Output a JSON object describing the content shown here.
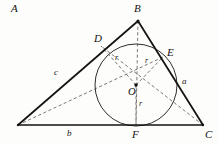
{
  "figure": {
    "background_color": "#fdfdfc",
    "stroke_color": "#15120f",
    "dash_color": "#5a5category"
  },
  "vertices": [
    {
      "name": "A",
      "label": "A",
      "x": 18,
      "y": 125,
      "label_x": 11,
      "label_y": 129
    },
    {
      "name": "B",
      "label": "B",
      "x": 138,
      "y": 21,
      "label_x": 134,
      "label_y": 3
    },
    {
      "name": "C",
      "label": "C",
      "x": 203,
      "y": 125,
      "label_x": 205,
      "label_y": 129
    }
  ],
  "tangent_points": [
    {
      "name": "D",
      "label": "D",
      "x": 101,
      "y": 46,
      "label_x": 94,
      "label_y": 33
    },
    {
      "name": "E",
      "label": "E",
      "x": 163,
      "y": 57,
      "label_x": 167,
      "label_y": 47
    },
    {
      "name": "F",
      "label": "F",
      "x": 136,
      "y": 125,
      "label_x": 132,
      "label_y": 129
    }
  ],
  "incenter": {
    "name": "O",
    "label": "O",
    "x": 136,
    "y": 85,
    "label_x": 128,
    "label_y": 87
  },
  "incircle": {
    "center_x": 136,
    "center_y": 85,
    "radius": 41
  },
  "side_labels": [
    {
      "name": "c",
      "label": "c",
      "side": "AB",
      "x": 54,
      "y": 68
    },
    {
      "name": "a",
      "label": "a",
      "side": "BC",
      "x": 182,
      "y": 77
    },
    {
      "name": "b",
      "label": "b",
      "side": "AC",
      "x": 67,
      "y": 129
    }
  ],
  "radius_labels": [
    {
      "name": "r-od",
      "label": "r",
      "x": 115,
      "y": 54
    },
    {
      "name": "r-oe",
      "label": "r",
      "x": 145,
      "y": 57
    },
    {
      "name": "r-of",
      "label": "r",
      "x": 139,
      "y": 100
    }
  ],
  "solid_segments": [
    {
      "name": "side-ab",
      "from": "A",
      "to": "B"
    },
    {
      "name": "side-bc",
      "from": "B",
      "to": "C"
    },
    {
      "name": "side-ac",
      "from": "A",
      "to": "C"
    }
  ],
  "dashed_segments": [
    {
      "name": "radius-od",
      "from": "O",
      "to": "D"
    },
    {
      "name": "radius-oe",
      "from": "O",
      "to": "E"
    },
    {
      "name": "radius-of",
      "from": "O",
      "to": "F"
    },
    {
      "name": "bisector-ao",
      "from": "A",
      "to": "E"
    },
    {
      "name": "bisector-bo",
      "from": "B",
      "to": "F"
    },
    {
      "name": "bisector-co",
      "from": "C",
      "to": "D"
    }
  ]
}
